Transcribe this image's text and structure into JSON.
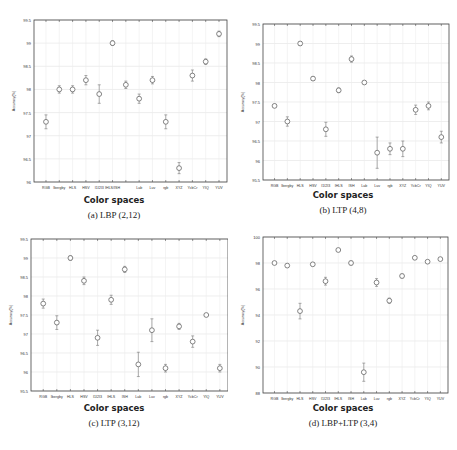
{
  "chart_data": [
    {
      "type": "scatter",
      "caption": "(a) LBP (2,12)",
      "xlabel": "Color spaces",
      "ylabel": "Accuracy(%)",
      "ylim": [
        96,
        99.5
      ],
      "yticks": [
        96,
        96.5,
        97,
        97.5,
        98,
        98.5,
        99,
        99.5
      ],
      "grid": true,
      "categories": [
        "RGB",
        "Ibergby",
        "HLS",
        "HSV",
        "I1I2I3",
        "IHLS",
        "ISH",
        "Lab",
        "Luv",
        "rgb",
        "XYZ",
        "YcbCr",
        "YIQ",
        "YUV"
      ],
      "tick_labels": [
        "RGB",
        "Ibergby",
        "HLS",
        "HSV",
        "I1I2I3",
        "IHLS/ISH",
        "",
        "Lab",
        "Luv",
        "rgb",
        "XYZ",
        "YcbCr",
        "YIQ",
        "YUV"
      ],
      "values": [
        97.3,
        98.0,
        98.0,
        98.2,
        97.9,
        99.0,
        98.1,
        97.8,
        98.2,
        97.3,
        96.3,
        98.3,
        98.6,
        99.2
      ],
      "errors": [
        0.15,
        0.08,
        0.08,
        0.1,
        0.2,
        0.05,
        0.08,
        0.1,
        0.08,
        0.15,
        0.12,
        0.12,
        0.06,
        0.06
      ]
    },
    {
      "type": "scatter",
      "caption": "(b) LTP (4,8)",
      "xlabel": "Color spaces",
      "ylabel": "Accuracy(%)",
      "ylim": [
        95.5,
        99.5
      ],
      "yticks": [
        95.5,
        96,
        96.5,
        97,
        97.5,
        98,
        98.5,
        99,
        99.5
      ],
      "grid": true,
      "categories": [
        "RGB",
        "Ibergby",
        "HLS",
        "HSV",
        "I1I2I3",
        "IHLS",
        "ISH",
        "Lab",
        "Luv",
        "rgb",
        "XYZ",
        "YcbCr",
        "YIQ",
        "YUV"
      ],
      "tick_labels": [
        "RGB",
        "Ibergby",
        "HLS",
        "HSV",
        "I1I2I3",
        "IHLS",
        "ISH",
        "Lab",
        "Luv",
        "rgb",
        "XYZ",
        "YcbCr",
        "YIQ",
        "YUV"
      ],
      "values": [
        97.4,
        97.0,
        99.0,
        98.1,
        96.8,
        97.8,
        98.6,
        98.0,
        96.2,
        96.3,
        96.3,
        97.3,
        97.4,
        96.6
      ],
      "errors": [
        0.04,
        0.12,
        0.05,
        0.04,
        0.18,
        0.06,
        0.08,
        0.03,
        0.4,
        0.15,
        0.2,
        0.12,
        0.1,
        0.15
      ]
    },
    {
      "type": "scatter",
      "caption": "(c) LTP (3,12)",
      "xlabel": "Color spaces",
      "ylabel": "Accuracy(%)",
      "ylim": [
        95.5,
        99.5
      ],
      "yticks": [
        95.5,
        96,
        96.5,
        97,
        97.5,
        98,
        98.5,
        99,
        99.5
      ],
      "grid": true,
      "categories": [
        "RGB",
        "Ibergby",
        "HLS",
        "HSV",
        "I1I2I3",
        "IHLS",
        "ISH",
        "Lab",
        "Luv",
        "rgb",
        "XYZ",
        "YcbCr",
        "YIQ",
        "YUV"
      ],
      "tick_labels": [
        "RGB",
        "Ibergby",
        "HLS",
        "HSV",
        "I1I2I3",
        "IHLS",
        "ISH",
        "Lab",
        "Luv",
        "rgb",
        "XYZ",
        "YcbCr",
        "YIQ",
        "YUV"
      ],
      "values": [
        97.8,
        97.3,
        99.0,
        98.4,
        96.9,
        97.9,
        98.7,
        96.2,
        97.1,
        96.1,
        97.2,
        96.8,
        97.5,
        96.1
      ],
      "errors": [
        0.12,
        0.18,
        0.06,
        0.1,
        0.2,
        0.12,
        0.08,
        0.32,
        0.3,
        0.1,
        0.08,
        0.15,
        0.03,
        0.1
      ]
    },
    {
      "type": "scatter",
      "caption": "(d) LBP+LTP (3,4)",
      "xlabel": "Color spaces",
      "ylabel": "Accuracy(%)",
      "ylim": [
        88,
        100
      ],
      "yticks": [
        88,
        90,
        92,
        94,
        96,
        98,
        100
      ],
      "grid": true,
      "categories": [
        "RGB",
        "Ibergby",
        "HLS",
        "HSV",
        "I1I2I3",
        "IHLS",
        "ISH",
        "Lab",
        "Luv",
        "rgb",
        "XYZ",
        "YcbCr",
        "YIQ",
        "YUV"
      ],
      "tick_labels": [
        "RGB",
        "Ibergby",
        "HLS",
        "HSV",
        "I1I2I3",
        "IHLS",
        "ISH",
        "Lab",
        "Luv",
        "rgb",
        "XYZ",
        "YcbCr",
        "YIQ",
        "YUV"
      ],
      "values": [
        98.0,
        97.8,
        94.3,
        97.9,
        96.6,
        99.0,
        98.0,
        89.6,
        96.5,
        95.1,
        97.0,
        98.4,
        98.1,
        98.3
      ],
      "errors": [
        0.1,
        0.1,
        0.6,
        0.1,
        0.3,
        0.1,
        0.15,
        0.7,
        0.3,
        0.2,
        0.15,
        0.1,
        0.1,
        0.1
      ]
    }
  ]
}
